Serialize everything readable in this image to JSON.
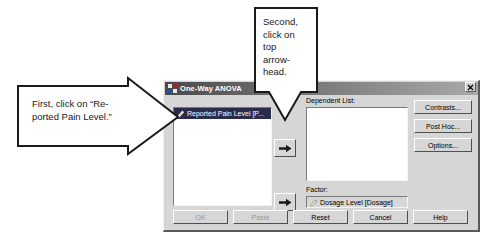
{
  "dialog": {
    "title": "One-Way ANOVA",
    "title_icon": "anova-window-icon",
    "close_label": "✕",
    "source_list": {
      "name": "source-variable-list",
      "items": [
        {
          "label": "Reported Pain Level [P...",
          "icon": "ruler-scale-icon",
          "selected": true
        }
      ]
    },
    "dependent_list": {
      "label": "Dependent List:",
      "items": []
    },
    "factor": {
      "label": "Factor:",
      "value": "Dosage Level [Dosage]",
      "icon": "ruler-scale-icon"
    },
    "arrow_buttons": [
      {
        "name": "move-to-dependent-list-arrow",
        "glyph": "➜"
      },
      {
        "name": "move-to-factor-arrow",
        "glyph": "➜"
      }
    ],
    "side_buttons": [
      {
        "label": "Contrasts...",
        "name": "contrasts-button"
      },
      {
        "label": "Post Hoc...",
        "name": "post-hoc-button"
      },
      {
        "label": "Options...",
        "name": "options-button"
      }
    ],
    "bottom_buttons": [
      {
        "label": "OK",
        "name": "ok-button",
        "disabled": true
      },
      {
        "label": "Paste",
        "name": "paste-button",
        "disabled": true
      },
      {
        "label": "Reset",
        "name": "reset-button",
        "disabled": false
      },
      {
        "label": "Cancel",
        "name": "cancel-button",
        "disabled": false
      },
      {
        "label": "Help",
        "name": "help-button",
        "disabled": false
      }
    ]
  },
  "annotations": {
    "left_callout": "First, click on “Re-\nported Pain Level.”",
    "top_callout": "Second,\nclick on\ntop\narrow-\nhead."
  },
  "colors": {
    "dialog_face": "#d6d6d6",
    "titlebar_dark": "#4a4a4a",
    "selection_blue": "#2b2b4e",
    "list_white": "#ffffff",
    "page_background": "#ffffff",
    "callout_stroke": "#1a1a1a"
  }
}
